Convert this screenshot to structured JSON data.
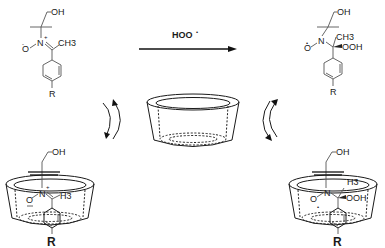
{
  "figure": {
    "type": "reaction-scheme"
  },
  "reactant": {
    "label_oh": "OH",
    "label_n": "N",
    "label_n_charge": "+",
    "label_o": "O",
    "label_o_charge": "-",
    "label_methyl": "CH3",
    "label_r": "R"
  },
  "product": {
    "label_oh": "OH",
    "label_n": "N",
    "label_o": "O",
    "label_o_radical": "•",
    "label_methyl": "CH3",
    "label_ooh": "OOH",
    "label_r": "R"
  },
  "reaction_arrow": {
    "reagent": "HOO",
    "reagent_radical": "•"
  },
  "host": {
    "name": "cyclodextrin"
  },
  "complex_left": {
    "label_oh": "OH",
    "label_n": "N",
    "label_n_charge": "+",
    "label_o": "O",
    "label_o_charge": "−",
    "label_h3": "H3",
    "label_r": "R"
  },
  "complex_right": {
    "label_oh": "OH",
    "label_n": "N",
    "label_o": "O",
    "label_o_radical": "•",
    "label_h3": "H3",
    "label_ooh": "OOH",
    "label_r": "R"
  }
}
